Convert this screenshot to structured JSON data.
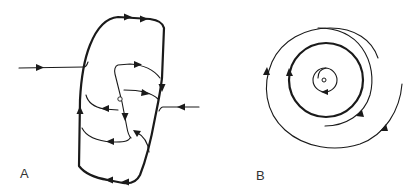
{
  "figure": {
    "panels": [
      {
        "label": "A",
        "description": "Phase portrait: closed orbit (limit cycle) with trajectories approaching from outside and spiraling from an interior fixed point",
        "elements": [
          "outer-closed-orbit",
          "incoming-trajectory-left",
          "incoming-trajectory-right",
          "interior-trajectories",
          "fixed-point"
        ]
      },
      {
        "label": "B",
        "description": "Phase portrait: concentric circular orbit around a fixed point with spiral trajectories inside and outside",
        "elements": [
          "fixed-point",
          "inner-circle",
          "limit-cycle",
          "outer-spiral",
          "inner-partial-arc"
        ]
      }
    ]
  },
  "colors": {
    "stroke": "#1a1a1a",
    "label": "#333333",
    "background": "#ffffff"
  }
}
